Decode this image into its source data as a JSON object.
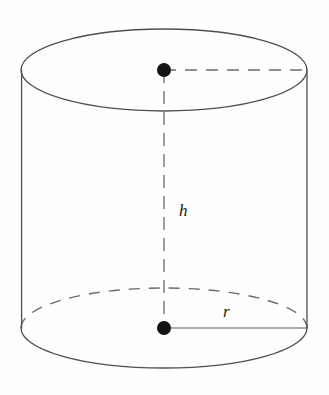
{
  "figure": {
    "kind": "cylinder-diagram",
    "background_color": "#fefefe",
    "stroke_color": "#555555",
    "dash_color": "#666666",
    "dot_color": "#141414",
    "label_color": "#1a1a1a"
  },
  "labels": {
    "height_label": "h",
    "radius_label": "r"
  },
  "geometry": {
    "center_x": 164,
    "top_center_y": 70,
    "bottom_center_y": 328,
    "radius_x": 143,
    "radius_y": 41,
    "left_side_x": 22,
    "right_side_x": 307,
    "dot_radius": 7
  },
  "annotations": {
    "height_segment": "vertical dashed segment from top center to bottom center",
    "top_radius_segment": "horizontal dashed segment from top center to right rim",
    "bottom_radius_segment": "horizontal solid segment from bottom center to right rim",
    "top_ellipse": "solid full ellipse (visible top face)",
    "bottom_front_arc": "solid front arc of base",
    "bottom_back_arc": "dashed hidden back arc of base"
  }
}
